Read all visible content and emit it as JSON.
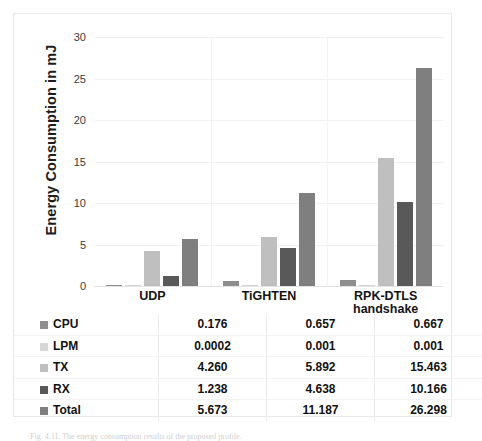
{
  "chart_data": {
    "type": "bar",
    "title": "",
    "xlabel": "",
    "ylabel": "Energy Consumption in mJ",
    "categories": [
      "UDP",
      "TiGHTEN",
      "RPK-DTLS handshake"
    ],
    "category_lines": [
      [
        "UDP"
      ],
      [
        "TiGHTEN"
      ],
      [
        "RPK-DTLS",
        "handshake"
      ]
    ],
    "ylim": [
      0,
      30
    ],
    "yticks": [
      0,
      5,
      10,
      15,
      20,
      25,
      30
    ],
    "ytick_labels": [
      "0",
      "5",
      "10",
      "15",
      "20",
      "25",
      "30"
    ],
    "grid": true,
    "legend_position": "table-below",
    "series": [
      {
        "name": "CPU",
        "values": [
          0.176,
          0.657,
          0.667
        ],
        "color": "#8e8e8e",
        "labels": [
          "0.176",
          "0.657",
          "0.667"
        ]
      },
      {
        "name": "LPM",
        "values": [
          0.0002,
          0.001,
          0.001
        ],
        "color": "#d6d6d6",
        "labels": [
          "0.0002",
          "0.001",
          "0.001"
        ]
      },
      {
        "name": "TX",
        "values": [
          4.26,
          5.892,
          15.463
        ],
        "color": "#bfbfbf",
        "labels": [
          "4.260",
          "5.892",
          "15.463"
        ]
      },
      {
        "name": "RX",
        "values": [
          1.238,
          4.638,
          10.166
        ],
        "color": "#595959",
        "labels": [
          "1.238",
          "4.638",
          "10.166"
        ]
      },
      {
        "name": "Total",
        "values": [
          5.673,
          11.187,
          26.298
        ],
        "color": "#7f7f7f",
        "labels": [
          "5.673",
          "11.187",
          "26.298"
        ]
      }
    ]
  },
  "data_table": {
    "column_headers": [
      "",
      "UDP",
      "TiGHTEN",
      "RPK-DTLS handshake"
    ],
    "rows": [
      {
        "label": "CPU",
        "swatch": "#8e8e8e",
        "cells": [
          "0.176",
          "0.657",
          "0.667"
        ]
      },
      {
        "label": "LPM",
        "swatch": "#d6d6d6",
        "cells": [
          "0.0002",
          "0.001",
          "0.001"
        ]
      },
      {
        "label": "TX",
        "swatch": "#bfbfbf",
        "cells": [
          "4.260",
          "5.892",
          "15.463"
        ]
      },
      {
        "label": "RX",
        "swatch": "#595959",
        "cells": [
          "1.238",
          "4.638",
          "10.166"
        ]
      },
      {
        "label": "Total",
        "swatch": "#7f7f7f",
        "cells": [
          "5.673",
          "11.187",
          "26.298"
        ]
      }
    ]
  },
  "caption": "Fig. 4.11. The energy consumption results of the proposed profile."
}
